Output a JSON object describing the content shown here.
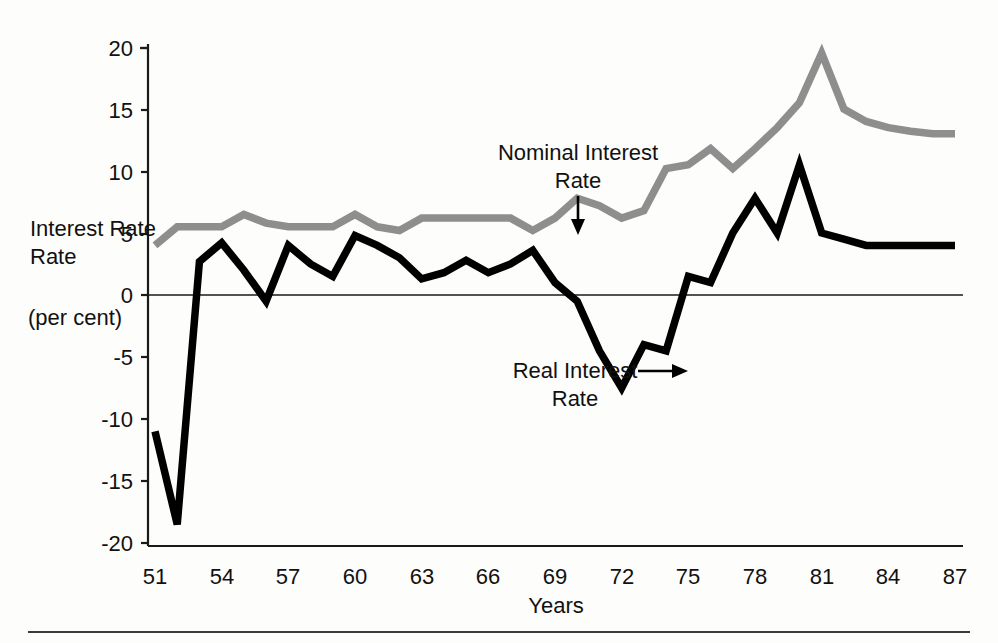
{
  "chart_data": {
    "type": "line",
    "title": "",
    "xlabel": "Years",
    "ylabel": "Interest Rate",
    "ylabel_units": "(per cent)",
    "grid": false,
    "legend_position": "inline-annotations",
    "xlim": [
      51,
      87
    ],
    "ylim": [
      -20,
      20
    ],
    "y_ticks": [
      "20",
      "15",
      "10",
      "5",
      "0",
      "-5",
      "-10",
      "-15",
      "-20"
    ],
    "y_tick_values": [
      20,
      15,
      10,
      5,
      0,
      -5,
      -10,
      -15,
      -20
    ],
    "x_ticks": [
      "51",
      "54",
      "57",
      "60",
      "63",
      "66",
      "69",
      "72",
      "75",
      "78",
      "81",
      "84",
      "87"
    ],
    "x_tick_values": [
      51,
      54,
      57,
      60,
      63,
      66,
      69,
      72,
      75,
      78,
      81,
      84,
      87
    ],
    "x": [
      51,
      52,
      53,
      54,
      55,
      56,
      57,
      58,
      59,
      60,
      61,
      62,
      63,
      64,
      65,
      66,
      67,
      68,
      69,
      70,
      71,
      72,
      73,
      74,
      75,
      76,
      77,
      78,
      79,
      80,
      81,
      82,
      83,
      84,
      85,
      86,
      87
    ],
    "series": [
      {
        "name": "Nominal Interest Rate",
        "color": "#8e8e8e",
        "values": [
          4.0,
          5.5,
          5.5,
          5.5,
          6.5,
          5.8,
          5.5,
          5.5,
          5.5,
          6.5,
          5.5,
          5.2,
          6.2,
          6.2,
          6.2,
          6.2,
          6.2,
          5.2,
          6.2,
          7.8,
          7.2,
          6.2,
          6.8,
          10.2,
          10.5,
          11.8,
          10.2,
          11.8,
          13.5,
          15.5,
          19.5,
          15.0,
          14.0,
          13.5,
          13.2,
          13.0,
          13.0
        ]
      },
      {
        "name": "Real Interest Rate",
        "color": "#000000",
        "values": [
          -11.0,
          -18.5,
          2.7,
          4.2,
          2.0,
          -0.5,
          4.0,
          2.5,
          1.5,
          4.8,
          4.0,
          3.0,
          1.3,
          1.8,
          2.8,
          1.8,
          2.5,
          3.6,
          1.0,
          -0.5,
          -4.5,
          -7.5,
          -4.0,
          -4.5,
          1.5,
          1.0,
          5.0,
          7.8,
          5.0,
          10.5,
          5.0,
          4.5,
          4.0,
          4.0,
          4.0,
          4.0,
          4.0
        ]
      }
    ],
    "annotations": [
      {
        "id": "nominal-annotation",
        "text_line1": "Nominal Interest",
        "text_line2": "Rate",
        "arrow": "down-arrow"
      },
      {
        "id": "real-annotation",
        "text_line1": "Real Interest",
        "text_line2": "Rate",
        "arrow": "right-arrow"
      }
    ]
  }
}
